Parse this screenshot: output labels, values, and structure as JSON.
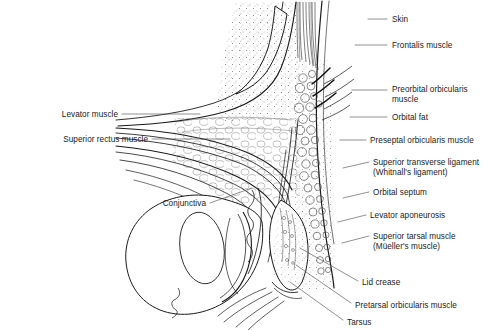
{
  "figure": {
    "background_color": "#ffffff",
    "ink_color": "#1a1a1a",
    "leader_color": "#555555",
    "width": 489,
    "height": 330
  },
  "labels": {
    "right": [
      {
        "id": "skin",
        "text": "Skin",
        "x": 392,
        "y": 15,
        "leader": {
          "x1": 368,
          "y1": 19,
          "x2": 387,
          "y2": 19
        }
      },
      {
        "id": "frontalis-muscle",
        "text": "Frontalis muscle",
        "x": 392,
        "y": 41,
        "leader": {
          "x1": 355,
          "y1": 45,
          "x2": 387,
          "y2": 45
        }
      },
      {
        "id": "preorbital-orbicularis-line1",
        "text": "Preorbital orbicularis",
        "x": 392,
        "y": 85,
        "leader": {
          "x1": 352,
          "y1": 90,
          "x2": 387,
          "y2": 90
        }
      },
      {
        "id": "preorbital-orbicularis-line2",
        "text": "muscle",
        "x": 392,
        "y": 95,
        "leader": null
      },
      {
        "id": "orbital-fat",
        "text": "Orbital fat",
        "x": 392,
        "y": 113,
        "leader": {
          "x1": 350,
          "y1": 117,
          "x2": 387,
          "y2": 117
        }
      },
      {
        "id": "preseptal-orbicularis-muscle",
        "text": "Preseptal orbicularis muscle",
        "x": 370,
        "y": 136,
        "leader": {
          "x1": 340,
          "y1": 140,
          "x2": 366,
          "y2": 140
        }
      },
      {
        "id": "whitnall-ligament-line1",
        "text": "Superior transverse ligament",
        "x": 373,
        "y": 158,
        "leader": {
          "x1": 343,
          "y1": 168,
          "x2": 369,
          "y2": 162
        }
      },
      {
        "id": "whitnall-ligament-line2",
        "text": "(Whitnall's ligament)",
        "x": 373,
        "y": 168,
        "leader": null
      },
      {
        "id": "orbital-septum",
        "text": "Orbital septum",
        "x": 373,
        "y": 188,
        "leader": {
          "x1": 343,
          "y1": 198,
          "x2": 369,
          "y2": 192
        }
      },
      {
        "id": "levator-aponeurosis",
        "text": "Levator aponeurosis",
        "x": 370,
        "y": 211,
        "leader": {
          "x1": 338,
          "y1": 222,
          "x2": 366,
          "y2": 215
        }
      },
      {
        "id": "superior-tarsal-muscle-line1",
        "text": "Superior tarsal muscle",
        "x": 373,
        "y": 232,
        "leader": {
          "x1": 342,
          "y1": 243,
          "x2": 369,
          "y2": 236
        }
      },
      {
        "id": "superior-tarsal-muscle-line2",
        "text": "(Müeller's muscle)",
        "x": 373,
        "y": 242,
        "leader": null
      },
      {
        "id": "lid-crease",
        "text": "Lid crease",
        "x": 362,
        "y": 278,
        "leader": {
          "x1": 300,
          "y1": 248,
          "x2": 358,
          "y2": 281
        }
      },
      {
        "id": "pretarsal-orbicularis-muscle",
        "text": "Pretarsal orbicularis muscle",
        "x": 355,
        "y": 301,
        "leader": {
          "x1": 296,
          "y1": 265,
          "x2": 351,
          "y2": 303
        }
      },
      {
        "id": "tarsus",
        "text": "Tarsus",
        "x": 347,
        "y": 318,
        "leader": {
          "x1": 290,
          "y1": 282,
          "x2": 343,
          "y2": 320
        }
      }
    ],
    "left": [
      {
        "id": "levator-muscle",
        "text": "Levator muscle",
        "x": 118,
        "y": 110,
        "leader": {
          "x1": 122,
          "y1": 114,
          "x2": 200,
          "y2": 114
        }
      },
      {
        "id": "superior-rectus-muscle",
        "text": "Superior rectus muscle",
        "x": 148,
        "y": 135,
        "leader": {
          "x1": 152,
          "y1": 139,
          "x2": 230,
          "y2": 139
        }
      },
      {
        "id": "conjunctiva",
        "text": "Conjunctiva",
        "x": 206,
        "y": 199,
        "leader": {
          "x1": 210,
          "y1": 203,
          "x2": 252,
          "y2": 188
        }
      }
    ]
  },
  "structures": [
    {
      "id": "orbital-rim-bone",
      "name": "superior orbital rim bone cross-section"
    },
    {
      "id": "orbital-fat-pad",
      "name": "orbital fat pad"
    },
    {
      "id": "frontalis-fibers",
      "name": "frontalis muscle fibers"
    },
    {
      "id": "orbicularis-bundles",
      "name": "orbicularis oculi muscle bundles"
    },
    {
      "id": "levator-palpebrae",
      "name": "levator palpebrae superioris"
    },
    {
      "id": "superior-rectus",
      "name": "superior rectus muscle"
    },
    {
      "id": "globe",
      "name": "globe / eyeball"
    },
    {
      "id": "cornea",
      "name": "cornea"
    },
    {
      "id": "tarsal-plate",
      "name": "tarsal plate with meibomian glands"
    },
    {
      "id": "conjunctival-fornix",
      "name": "superior conjunctival fornix"
    },
    {
      "id": "eyelashes",
      "name": "eyelashes at lid margin"
    }
  ]
}
